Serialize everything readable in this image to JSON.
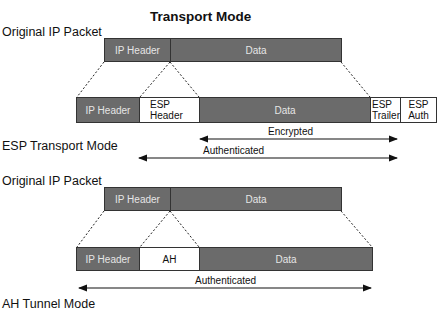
{
  "title": "Transport Mode",
  "sections": {
    "esp_original_label": "Original IP Packet",
    "esp_mode_label": "ESP Transport Mode",
    "ah_original_label": "Original IP Packet",
    "ah_mode_label": "AH Tunnel Mode"
  },
  "esp_original_packet": [
    {
      "label": "IP Header"
    },
    {
      "label": "Data"
    }
  ],
  "esp_packet": [
    {
      "label": "IP Header"
    },
    {
      "label": "ESP Header"
    },
    {
      "label": "Data"
    },
    {
      "label": "ESP Trailer"
    },
    {
      "label": "ESP Auth"
    }
  ],
  "esp_arrows": {
    "encrypted": "Encrypted",
    "authenticated": "Authenticated"
  },
  "ah_original_packet": [
    {
      "label": "IP Header"
    },
    {
      "label": "Data"
    }
  ],
  "ah_packet": [
    {
      "label": "IP Header"
    },
    {
      "label": "AH"
    },
    {
      "label": "Data"
    }
  ],
  "ah_arrows": {
    "authenticated": "Authenticated"
  },
  "colors": {
    "dark_field": "#6b6b6b",
    "light_field": "#ffffff",
    "line": "#222222"
  }
}
